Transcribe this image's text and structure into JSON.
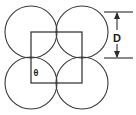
{
  "figure": {
    "background_color": "#ffffff",
    "line_color": "#3a3a3a",
    "square_color": "#2b2b2b",
    "labels": {
      "diameter": "D",
      "angle": "θ"
    },
    "geometry": {
      "circle_radius": 26,
      "circle_centers": [
        {
          "name": "top-left",
          "cx": 31,
          "cy": 32
        },
        {
          "name": "top-right",
          "cx": 82,
          "cy": 32
        },
        {
          "name": "bottom-left",
          "cx": 31,
          "cy": 83
        },
        {
          "name": "bottom-right",
          "cx": 82,
          "cy": 83
        }
      ],
      "square": {
        "x": 31,
        "y": 32,
        "width": 51,
        "height": 51
      },
      "dimension": {
        "axis": "vertical",
        "x": 117,
        "y_top": 12,
        "y_bottom": 58,
        "extension_line_x_start": 104,
        "extension_line_x_end": 133,
        "label_x": 117,
        "label_y": 39
      },
      "angle_label": {
        "x": 36,
        "y": 74
      }
    }
  }
}
